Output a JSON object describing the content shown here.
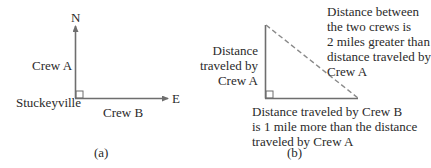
{
  "panel_a": {
    "caption": "(a)",
    "north_label": "N",
    "east_label": "E",
    "origin_label": "Stuckeyville",
    "crew_a_label": "Crew A",
    "crew_b_label": "Crew B"
  },
  "panel_b": {
    "caption": "(b)",
    "leg_a_label": [
      "Distance",
      "traveled by",
      "Crew A"
    ],
    "hypotenuse_label": [
      "Distance between",
      "the two crews is",
      "2 miles greater than",
      "distance traveled by",
      "Crew A"
    ],
    "leg_b_label": [
      "Distance traveled by Crew B",
      "is 1 mile more than the distance",
      "traveled by Crew A"
    ]
  },
  "colors": {
    "line": "#6e6e6e",
    "text": "#2a2a2a",
    "background": "#ffffff"
  }
}
